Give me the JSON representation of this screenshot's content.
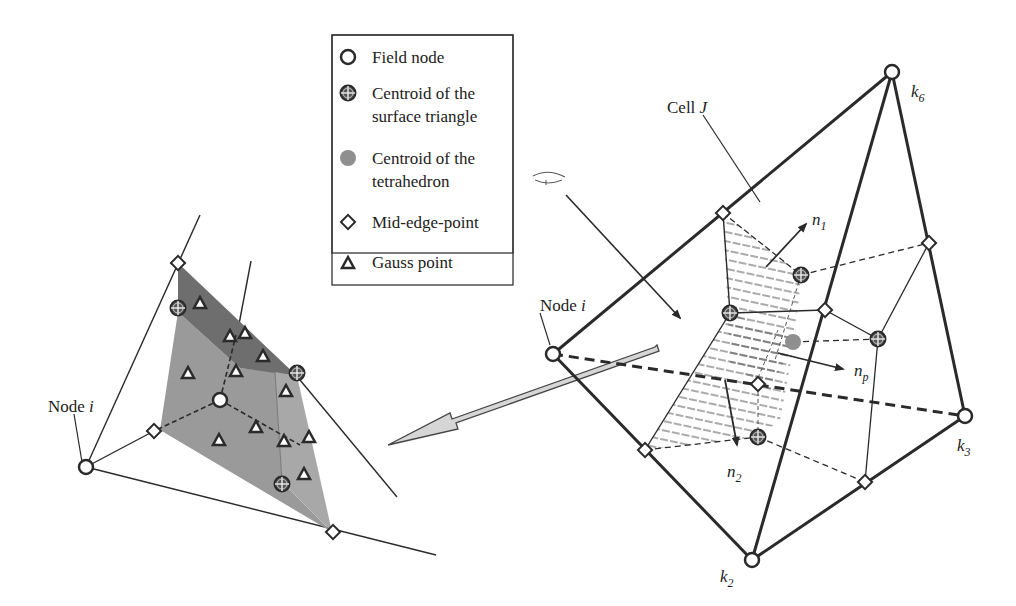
{
  "legend": {
    "items": [
      {
        "symbol": "field-node",
        "lines": [
          "Field node"
        ]
      },
      {
        "symbol": "centroid-surface-triangle",
        "lines": [
          "Centroid of the",
          "surface triangle"
        ]
      },
      {
        "symbol": "centroid-tetrahedron",
        "lines": [
          "Centroid of the",
          "tetrahedron"
        ]
      },
      {
        "symbol": "mid-edge-point",
        "lines": [
          "Mid-edge-point"
        ]
      },
      {
        "symbol": "gauss-point",
        "lines": [
          "Gauss point"
        ]
      }
    ]
  },
  "left_view": {
    "node_label": "Node i",
    "node_label_main": "Node ",
    "node_label_var": "i"
  },
  "right_view": {
    "node_label_main": "Node ",
    "node_label_var": "i",
    "cell_label_main": "Cell ",
    "cell_label_var": "J",
    "k6": {
      "base": "k",
      "sub": "6"
    },
    "k3": {
      "base": "k",
      "sub": "3"
    },
    "k2": {
      "base": "k",
      "sub": "2"
    },
    "n1": {
      "base": "n",
      "sub": "1"
    },
    "n2": {
      "base": "n",
      "sub": "2"
    },
    "np": {
      "base": "n",
      "sub": "p"
    }
  },
  "colors": {
    "line": "#2a2a2a",
    "face_light": "#9a9a9a",
    "face_dark": "#6e6e6e",
    "centroid_tet": "#8f8f8f",
    "arrow_fill": "#d6d6d6"
  }
}
